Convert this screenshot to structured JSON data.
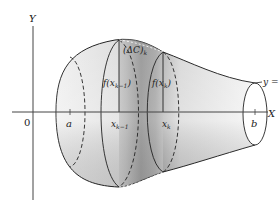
{
  "figure": {
    "type": "solid-of-revolution",
    "axes": {
      "y_label": "Y",
      "x_label": "X",
      "origin_label": "0"
    },
    "x_ticks": {
      "a": "a",
      "x_k_minus_1": "x",
      "x_k_minus_1_sub": "k−1",
      "x_k": "x",
      "x_k_sub": "k",
      "b": "b"
    },
    "annotations": {
      "f_xk_minus_1_prefix": "f(x",
      "f_xk_minus_1_sub": "k−1",
      "f_xk_minus_1_suffix": ")",
      "f_xk_prefix": "f(x",
      "f_xk_sub": "k",
      "f_xk_suffix": ")",
      "delta_c_open": "(ΔC)",
      "delta_c_sub": "k",
      "curve_label": "y = f(x)"
    },
    "colors": {
      "line": "#222222",
      "shade_light": "#f2f2f2",
      "shade_mid": "#cfcfcf",
      "shade_dark": "#8a8a8a"
    }
  }
}
